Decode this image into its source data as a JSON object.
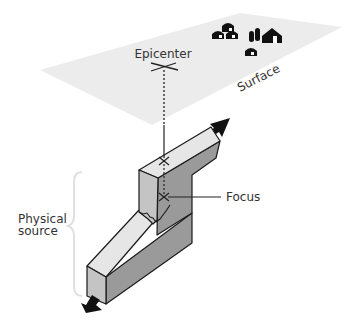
{
  "diagram": {
    "labels": {
      "epicenter": "Epicenter",
      "surface": "Surface",
      "focus": "Focus",
      "physical_source_line1": "Physical",
      "physical_source_line2": "source"
    },
    "colors": {
      "surface_fill": "#ececec",
      "block_top": "#e6e6e6",
      "block_end": "#c4c4c4",
      "block_side": "#9a9a9a",
      "outline": "#1a1a1a",
      "arrow": "#111111",
      "brace": "#e0e0e0"
    },
    "icons": [
      "house-icon",
      "silo-icon",
      "barn-icon",
      "slip-arrow-icon",
      "cross-marker-icon"
    ]
  }
}
